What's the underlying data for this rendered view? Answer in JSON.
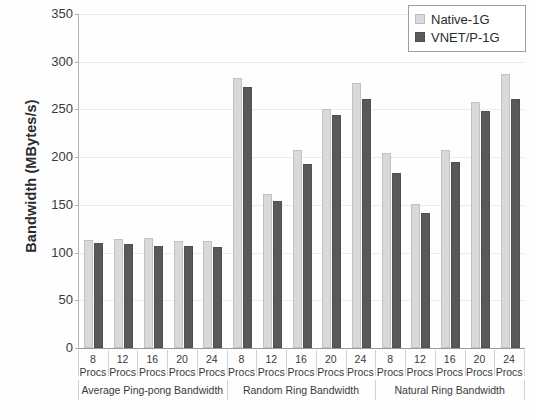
{
  "chart_data": {
    "type": "bar",
    "title": "",
    "xlabel": "",
    "ylabel": "Bandwidth (MBytes/s)",
    "ylim": [
      0,
      350
    ],
    "ytick_labels": [
      "0",
      "50",
      "100",
      "150",
      "200",
      "250",
      "300",
      "350"
    ],
    "ytick_values": [
      0,
      50,
      100,
      150,
      200,
      250,
      300,
      350
    ],
    "grid": true,
    "legend_position": "top-right",
    "categories": [
      "8 Procs",
      "12 Procs",
      "16 Procs",
      "20 Procs",
      "24 Procs",
      "8 Procs",
      "12 Procs",
      "16 Procs",
      "20 Procs",
      "24 Procs",
      "8 Procs",
      "12 Procs",
      "16 Procs",
      "20 Procs",
      "24 Procs"
    ],
    "category_numbers": [
      "8",
      "12",
      "16",
      "20",
      "24",
      "8",
      "12",
      "16",
      "20",
      "24",
      "8",
      "12",
      "16",
      "20",
      "24"
    ],
    "category_unit": "Procs",
    "groups": [
      {
        "label": "Average Ping-pong Bandwidth",
        "start": 0,
        "count": 5
      },
      {
        "label": "Random Ring Bandwidth",
        "start": 5,
        "count": 5
      },
      {
        "label": "Natural Ring Bandwidth",
        "start": 10,
        "count": 5
      }
    ],
    "series": [
      {
        "name": "Native-1G",
        "color": "#d9d9d9",
        "values": [
          113,
          114,
          115,
          112,
          112,
          283,
          161,
          208,
          250,
          278,
          204,
          151,
          208,
          258,
          287
        ]
      },
      {
        "name": "VNET/P-1G",
        "color": "#595959",
        "values": [
          110,
          109,
          107,
          107,
          106,
          273,
          154,
          193,
          244,
          261,
          183,
          142,
          195,
          248,
          261
        ]
      }
    ]
  },
  "legend": {
    "items": [
      {
        "label": "Native-1G",
        "swatch": "light"
      },
      {
        "label": "VNET/P-1G",
        "swatch": "dark"
      }
    ]
  }
}
